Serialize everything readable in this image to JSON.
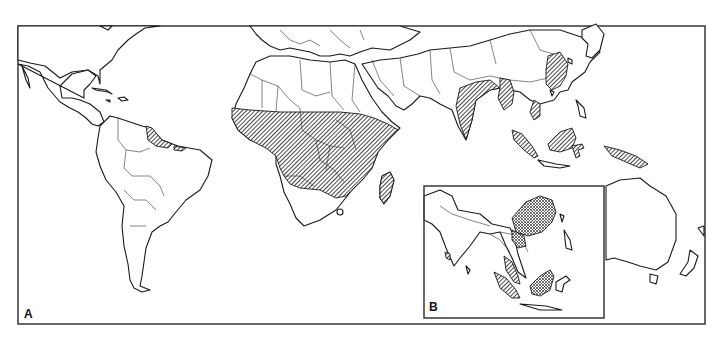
{
  "figure": {
    "panels": [
      {
        "id": "A",
        "label": "A",
        "description": "World map (Americas, Africa, Asia, Oceania) with hatched distribution regions"
      },
      {
        "id": "B",
        "label": "B",
        "description": "Inset of South and Southeast Asia with cross-hatched regions"
      }
    ],
    "legend": [],
    "shaded_regions_panel_A": [
      "Sub-Saharan Africa (West, Central, East and south-central Africa)",
      "Madagascar",
      "Guianas / northern South America coast",
      "Northeastern Brazil coast",
      "Caribbean (Hispaniola)",
      "India (east and north-east)",
      "Myanmar / Bangladesh",
      "Southeastern China",
      "Vietnam (south)",
      "Sumatra",
      "Borneo",
      "Sulawesi",
      "New Guinea"
    ],
    "shaded_regions_panel_B": [
      "Southeastern China",
      "Northern Vietnam",
      "Malay Peninsula",
      "Sumatra",
      "Borneo",
      "Western India (small)"
    ],
    "colors": {
      "ink": "#1a1a1a",
      "background": "#ffffff",
      "frame": "#444444"
    }
  }
}
